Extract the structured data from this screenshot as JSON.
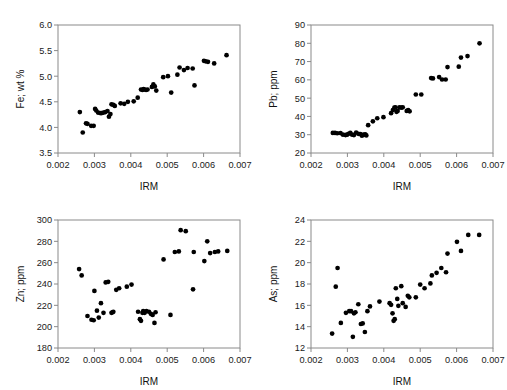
{
  "figure": {
    "title": "",
    "background": "#ffffff",
    "point_color": "#000000",
    "axis_color": "#8a8a8a",
    "panel_count": 4
  },
  "chart_data": [
    {
      "type": "scatter",
      "title": "",
      "xlabel": "IRM",
      "ylabel": "Fe; wt %",
      "xlim": [
        0.002,
        0.007
      ],
      "ylim": [
        3.5,
        6.0
      ],
      "xticks": [
        0.002,
        0.003,
        0.004,
        0.005,
        0.006,
        0.007
      ],
      "xtick_labels": [
        "0.002",
        "0.003",
        "0.004",
        "0.005",
        "0.006",
        "0.007"
      ],
      "yticks": [
        3.5,
        4.0,
        4.5,
        5.0,
        5.5,
        6.0
      ],
      "ytick_labels": [
        "3.5",
        "4.0",
        "4.5",
        "5.0",
        "5.5",
        "6.0"
      ],
      "grid": false,
      "legend": null,
      "x": [
        0.0026,
        0.00268,
        0.00277,
        0.00281,
        0.00291,
        0.00298,
        0.00302,
        0.00305,
        0.0031,
        0.00316,
        0.0032,
        0.00325,
        0.0033,
        0.00336,
        0.0034,
        0.00344,
        0.00347,
        0.00352,
        0.00356,
        0.00372,
        0.00382,
        0.00392,
        0.00408,
        0.00419,
        0.00428,
        0.00432,
        0.00435,
        0.00438,
        0.00442,
        0.00446,
        0.00458,
        0.00462,
        0.00466,
        0.0047,
        0.00489,
        0.00502,
        0.00511,
        0.00528,
        0.00534,
        0.00546,
        0.00556,
        0.0057,
        0.00575,
        0.00601,
        0.00606,
        0.00612,
        0.00629,
        0.00663
      ],
      "y": [
        4.3,
        3.9,
        4.08,
        4.07,
        4.03,
        4.03,
        4.36,
        4.33,
        4.29,
        4.28,
        4.28,
        4.29,
        4.3,
        4.32,
        4.21,
        4.26,
        4.45,
        4.44,
        4.42,
        4.47,
        4.46,
        4.5,
        4.51,
        4.58,
        4.74,
        4.73,
        4.75,
        4.74,
        4.73,
        4.74,
        4.79,
        4.84,
        4.8,
        4.72,
        4.98,
        5.0,
        4.68,
        5.03,
        5.17,
        5.12,
        5.16,
        5.15,
        4.82,
        5.3,
        5.29,
        5.28,
        5.25,
        5.41
      ]
    },
    {
      "type": "scatter",
      "title": "",
      "xlabel": "IRM",
      "ylabel": "Pb; ppm",
      "xlim": [
        0.002,
        0.007
      ],
      "ylim": [
        20,
        90
      ],
      "xticks": [
        0.002,
        0.003,
        0.004,
        0.005,
        0.006,
        0.007
      ],
      "xtick_labels": [
        "0.002",
        "0.003",
        "0.004",
        "0.005",
        "0.006",
        "0.007"
      ],
      "yticks": [
        20,
        30,
        40,
        50,
        60,
        70,
        80,
        90
      ],
      "ytick_labels": [
        "20",
        "30",
        "40",
        "50",
        "60",
        "70",
        "80",
        "90"
      ],
      "grid": false,
      "legend": null,
      "x": [
        0.0026,
        0.00266,
        0.00272,
        0.00281,
        0.00288,
        0.00295,
        0.00299,
        0.00303,
        0.00308,
        0.00313,
        0.00318,
        0.00324,
        0.0033,
        0.00336,
        0.0034,
        0.00345,
        0.00349,
        0.00352,
        0.00357,
        0.0037,
        0.00382,
        0.00399,
        0.0042,
        0.00425,
        0.00429,
        0.00432,
        0.00435,
        0.00438,
        0.00443,
        0.00448,
        0.00452,
        0.00463,
        0.00467,
        0.00471,
        0.00488,
        0.00503,
        0.0053,
        0.00535,
        0.00552,
        0.0056,
        0.0057,
        0.00575,
        0.00606,
        0.00612,
        0.0063,
        0.00663
      ],
      "y": [
        31.0,
        31.0,
        30.8,
        30.9,
        30.0,
        29.8,
        30.0,
        30.5,
        31.0,
        30.0,
        29.8,
        31.2,
        30.5,
        30.3,
        29.5,
        30.0,
        30.2,
        29.6,
        35.2,
        37.3,
        39.0,
        39.6,
        41.8,
        43.5,
        44.8,
        45.0,
        42.5,
        43.0,
        45.0,
        44.8,
        45.0,
        43.0,
        43.5,
        42.8,
        52.0,
        52.0,
        61.0,
        60.8,
        61.5,
        60.2,
        60.2,
        67.0,
        67.2,
        72.2,
        73.0,
        80.0
      ]
    },
    {
      "type": "scatter",
      "title": "",
      "xlabel": "IRM",
      "ylabel": "Zn; ppm",
      "xlim": [
        0.002,
        0.007
      ],
      "ylim": [
        180,
        300
      ],
      "xticks": [
        0.002,
        0.003,
        0.004,
        0.005,
        0.006,
        0.007
      ],
      "xtick_labels": [
        "0.002",
        "0.003",
        "0.004",
        "0.005",
        "0.006",
        "0.007"
      ],
      "yticks": [
        180,
        200,
        220,
        240,
        260,
        280,
        300
      ],
      "ytick_labels": [
        "180",
        "200",
        "220",
        "240",
        "260",
        "280",
        "300"
      ],
      "grid": false,
      "legend": null,
      "x": [
        0.00258,
        0.00265,
        0.00281,
        0.00292,
        0.00298,
        0.003,
        0.00307,
        0.00312,
        0.00318,
        0.00325,
        0.00331,
        0.00338,
        0.00347,
        0.0035,
        0.00352,
        0.0036,
        0.00368,
        0.00389,
        0.00402,
        0.0042,
        0.00425,
        0.00428,
        0.00432,
        0.00434,
        0.00438,
        0.00443,
        0.0045,
        0.00455,
        0.0046,
        0.00465,
        0.00468,
        0.0049,
        0.00509,
        0.00521,
        0.00532,
        0.00537,
        0.00551,
        0.00571,
        0.00573,
        0.00602,
        0.0061,
        0.00618,
        0.00631,
        0.0064,
        0.00665
      ],
      "y": [
        254.0,
        248.0,
        210.0,
        206.5,
        206.0,
        233.5,
        215.0,
        208.5,
        222.0,
        213.0,
        241.5,
        242.0,
        213.0,
        213.5,
        214.0,
        234.5,
        236.0,
        237.5,
        239.5,
        214.0,
        207.0,
        205.5,
        213.0,
        214.5,
        213.0,
        214.5,
        214.0,
        212.0,
        211.0,
        203.5,
        213.5,
        263.0,
        211.0,
        270.0,
        270.5,
        290.5,
        289.5,
        235.0,
        270.0,
        261.5,
        280.0,
        269.0,
        270.0,
        270.5,
        271.0
      ]
    },
    {
      "type": "scatter",
      "title": "",
      "xlabel": "IRM",
      "ylabel": "As; ppm",
      "xlim": [
        0.002,
        0.007
      ],
      "ylim": [
        12,
        24
      ],
      "xticks": [
        0.002,
        0.003,
        0.004,
        0.005,
        0.006,
        0.007
      ],
      "xtick_labels": [
        "0.002",
        "0.003",
        "0.004",
        "0.005",
        "0.006",
        "0.007"
      ],
      "yticks": [
        12,
        14,
        16,
        18,
        20,
        22,
        24
      ],
      "ytick_labels": [
        "12",
        "14",
        "16",
        "18",
        "20",
        "22",
        "24"
      ],
      "grid": false,
      "legend": null,
      "x": [
        0.00258,
        0.00268,
        0.00273,
        0.00282,
        0.00296,
        0.00305,
        0.0031,
        0.00315,
        0.00318,
        0.00322,
        0.0033,
        0.00337,
        0.00342,
        0.00348,
        0.00355,
        0.00362,
        0.00388,
        0.00416,
        0.0042,
        0.00424,
        0.00427,
        0.0043,
        0.00433,
        0.00437,
        0.0044,
        0.00448,
        0.00452,
        0.0046,
        0.00466,
        0.0047,
        0.00488,
        0.005,
        0.00512,
        0.00528,
        0.00532,
        0.00545,
        0.00558,
        0.00571,
        0.00575,
        0.00601,
        0.00612,
        0.00632,
        0.00662
      ],
      "y": [
        13.35,
        17.75,
        19.5,
        14.35,
        15.3,
        15.45,
        15.45,
        13.05,
        15.25,
        15.35,
        16.1,
        14.25,
        14.3,
        13.5,
        15.45,
        15.9,
        16.35,
        16.2,
        16.05,
        15.25,
        14.55,
        14.7,
        17.6,
        16.6,
        15.95,
        17.8,
        16.2,
        15.85,
        16.9,
        16.75,
        16.75,
        17.95,
        17.6,
        18.05,
        18.8,
        19.05,
        19.5,
        19.1,
        20.85,
        21.95,
        21.1,
        22.6,
        22.6
      ]
    }
  ]
}
